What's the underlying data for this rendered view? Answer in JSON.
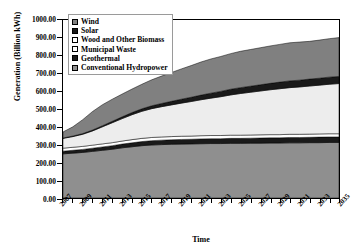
{
  "chart_data": {
    "type": "area",
    "stacked": true,
    "title": "",
    "xlabel": "Time",
    "ylabel": "Generation (Billion kWh)",
    "ylim": [
      0,
      1000
    ],
    "ytick_step": 100,
    "ytick_labels": [
      "1000.00",
      "900.00",
      "800.00",
      "700.00",
      "600.00",
      "500.00",
      "400.00",
      "300.00",
      "200.00",
      "100.00",
      "0.00"
    ],
    "ytick_values": [
      1000,
      900,
      800,
      700,
      600,
      500,
      400,
      300,
      200,
      100,
      0
    ],
    "grid": false,
    "legend_position": "top-left-inside",
    "xlim": [
      2007,
      2035
    ],
    "x": [
      2007,
      2008,
      2009,
      2010,
      2011,
      2012,
      2013,
      2014,
      2015,
      2016,
      2017,
      2018,
      2019,
      2020,
      2021,
      2022,
      2023,
      2024,
      2025,
      2026,
      2027,
      2028,
      2029,
      2030,
      2031,
      2032,
      2033,
      2034,
      2035
    ],
    "xtick_labels": [
      "2007",
      "2009",
      "2011",
      "2013",
      "2015",
      "2017",
      "2019",
      "2021",
      "2023",
      "2025",
      "2027",
      "2029",
      "2031",
      "2033",
      "2035"
    ],
    "xtick_values": [
      2007,
      2009,
      2011,
      2013,
      2015,
      2017,
      2019,
      2021,
      2023,
      2025,
      2027,
      2029,
      2031,
      2033,
      2035
    ],
    "series": [
      {
        "name": "Conventional Hydropower",
        "color": "#8f8f8f",
        "order": 1,
        "values": [
          248,
          252,
          256,
          262,
          268,
          274,
          282,
          288,
          294,
          298,
          300,
          302,
          303,
          304,
          305,
          306,
          306,
          307,
          307,
          308,
          308,
          309,
          309,
          310,
          310,
          311,
          311,
          312,
          312
        ]
      },
      {
        "name": "Geothermal",
        "color": "#1a1a1a",
        "order": 2,
        "values": [
          15,
          16,
          17,
          18,
          19,
          20,
          21,
          22,
          23,
          24,
          25,
          25,
          26,
          26,
          27,
          27,
          27,
          28,
          28,
          28,
          29,
          29,
          29,
          30,
          30,
          30,
          31,
          31,
          31
        ]
      },
      {
        "name": "Municipal Waste",
        "color": "#ffffff",
        "order": 3,
        "values": [
          17,
          17,
          17,
          17,
          17,
          17,
          17,
          18,
          18,
          18,
          18,
          18,
          18,
          18,
          18,
          18,
          18,
          18,
          18,
          18,
          18,
          18,
          18,
          18,
          18,
          18,
          18,
          18,
          18
        ]
      },
      {
        "name": "Wood and Other Biomass",
        "color": "#ededed",
        "order": 4,
        "values": [
          55,
          60,
          68,
          80,
          96,
          112,
          126,
          140,
          152,
          162,
          170,
          178,
          186,
          194,
          202,
          210,
          218,
          226,
          234,
          240,
          246,
          252,
          258,
          262,
          266,
          270,
          274,
          278,
          282
        ]
      },
      {
        "name": "Solar",
        "color": "#1a1a1a",
        "order": 5,
        "values": [
          2,
          3,
          4,
          5,
          6,
          8,
          10,
          12,
          14,
          16,
          18,
          20,
          22,
          24,
          26,
          28,
          30,
          32,
          33,
          34,
          35,
          36,
          37,
          38,
          38,
          39,
          39,
          40,
          40
        ]
      },
      {
        "name": "Wind",
        "color": "#808080",
        "order": 6,
        "values": [
          34,
          52,
          78,
          104,
          118,
          124,
          128,
          132,
          138,
          146,
          154,
          162,
          170,
          178,
          186,
          192,
          196,
          200,
          204,
          206,
          208,
          210,
          212,
          214,
          214,
          212,
          214,
          216,
          218
        ]
      }
    ]
  },
  "legend": {
    "items": [
      {
        "label": "Wind",
        "swatch": "#808080"
      },
      {
        "label": "Solar",
        "swatch": "#1a1a1a"
      },
      {
        "label": "Wood and Other Biomass",
        "swatch": "#ffffff"
      },
      {
        "label": "Municipal Waste",
        "swatch": "#ffffff"
      },
      {
        "label": "Geothermal",
        "swatch": "#1a1a1a"
      },
      {
        "label": "Conventional Hydropower",
        "swatch": "#8f8f8f"
      }
    ]
  }
}
